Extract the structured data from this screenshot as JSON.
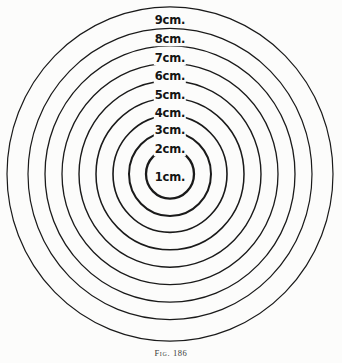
{
  "figure": {
    "caption_prefix": "Fig.",
    "caption_number": "186",
    "background_color": "#fcfcfb",
    "stroke_color": "#1a1a1a",
    "label_color": "#141414"
  },
  "chart_data": {
    "type": "scatter",
    "title": "",
    "subtitle": "",
    "xlabel": "",
    "ylabel": "",
    "grid": false,
    "legend_position": "none",
    "annotations": [
      "Fig. 186"
    ],
    "center": {
      "x": 170,
      "y": 174
    },
    "radius_unit_px": 17.2,
    "categories": [
      "1cm.",
      "2cm.",
      "3cm.",
      "4cm.",
      "5cm.",
      "6cm.",
      "7cm.",
      "8cm.",
      "9cm."
    ],
    "values": [
      1,
      2,
      3,
      4,
      5,
      6,
      7,
      8,
      9
    ],
    "rings": [
      {
        "label": "1cm.",
        "value": 1,
        "radius_px": 24.0,
        "stroke_width": 2.3,
        "label_x": 170,
        "label_y": 178,
        "font_size": 11.5
      },
      {
        "label": "2cm.",
        "value": 2,
        "radius_px": 41.0,
        "stroke_width": 2.0,
        "label_x": 170,
        "label_y": 150,
        "font_size": 11.5
      },
      {
        "label": "3cm.",
        "value": 3,
        "radius_px": 57.0,
        "stroke_width": 1.6,
        "label_x": 170,
        "label_y": 131,
        "font_size": 11.5
      },
      {
        "label": "4cm.",
        "value": 4,
        "radius_px": 74.0,
        "stroke_width": 1.5,
        "label_x": 170,
        "label_y": 114,
        "font_size": 11.5
      },
      {
        "label": "5cm.",
        "value": 5,
        "radius_px": 91.0,
        "stroke_width": 1.4,
        "label_x": 170,
        "label_y": 96,
        "font_size": 11.5
      },
      {
        "label": "6cm.",
        "value": 6,
        "radius_px": 108.0,
        "stroke_width": 1.3,
        "label_x": 170,
        "label_y": 77,
        "font_size": 11.5
      },
      {
        "label": "7cm.",
        "value": 7,
        "radius_px": 125.0,
        "stroke_width": 1.3,
        "label_x": 170,
        "label_y": 59,
        "font_size": 11.5
      },
      {
        "label": "8cm.",
        "value": 8,
        "radius_px": 142.0,
        "stroke_width": 1.2,
        "label_x": 170,
        "label_y": 40,
        "font_size": 11.5
      },
      {
        "label": "9cm.",
        "value": 9,
        "radius_px": 163.0,
        "stroke_width": 1.2,
        "label_x": 170,
        "label_y": 21,
        "font_size": 11.5
      }
    ]
  },
  "caption": {
    "text": "Fig. 186",
    "x": 171,
    "y": 348,
    "font_size": 8.5
  }
}
